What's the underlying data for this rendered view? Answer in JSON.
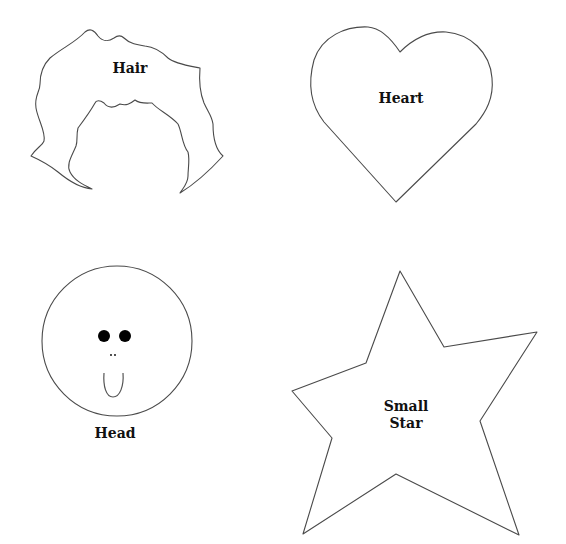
{
  "page": {
    "background": "#ffffff",
    "stroke_color": "#4a4a4a"
  },
  "shapes": {
    "hair": {
      "label": "Hair"
    },
    "heart": {
      "label": "Heart"
    },
    "head": {
      "label": "Head"
    },
    "star": {
      "label_line1": "Small",
      "label_line2": "Star"
    }
  }
}
